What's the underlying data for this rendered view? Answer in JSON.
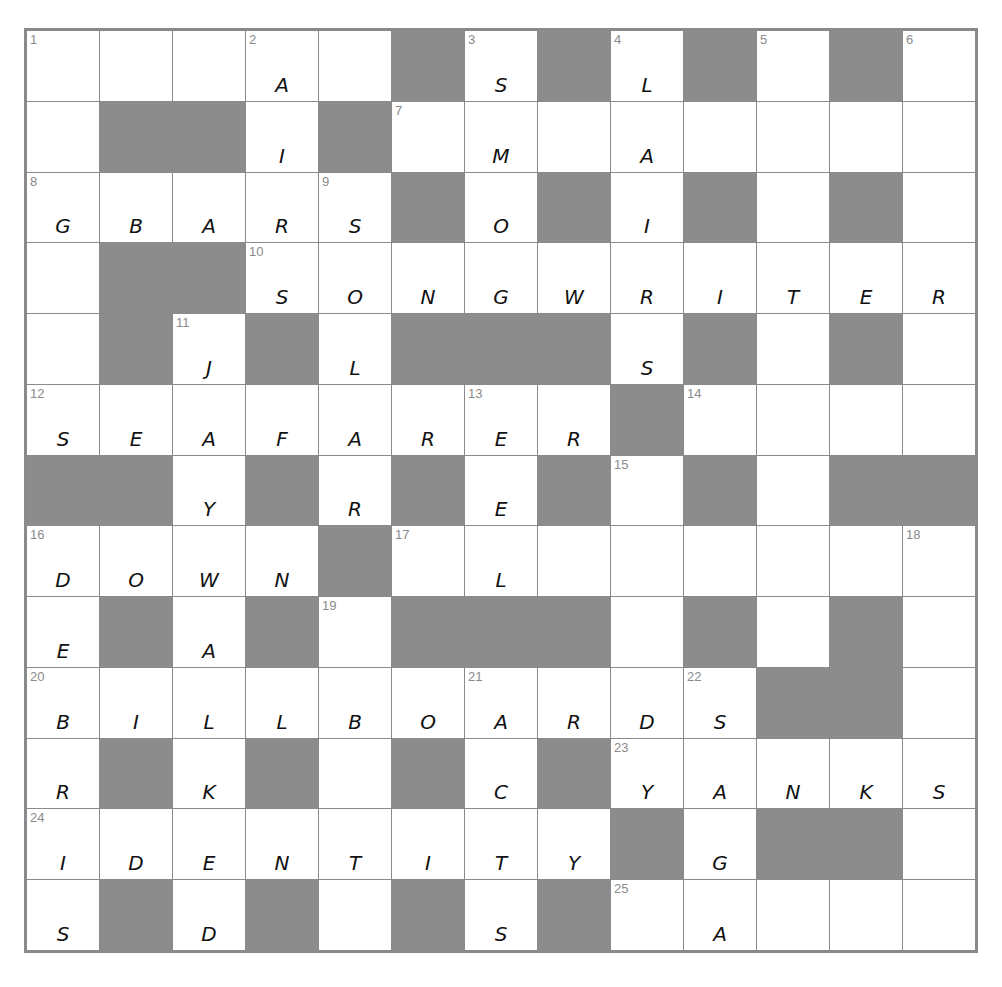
{
  "puzzle": {
    "size": 13,
    "colors": {
      "block": "#8c8c8c",
      "line": "#8a8a8a",
      "cell": "#ffffff",
      "ink": "#111111"
    },
    "rows": [
      [
        {
          "n": "1",
          "l": ""
        },
        {
          "n": "",
          "l": ""
        },
        {
          "n": "",
          "l": ""
        },
        {
          "n": "2",
          "l": "A"
        },
        {
          "n": "",
          "l": ""
        },
        {
          "b": 1
        },
        {
          "n": "3",
          "l": "S"
        },
        {
          "b": 1
        },
        {
          "n": "4",
          "l": "L"
        },
        {
          "b": 1
        },
        {
          "n": "5",
          "l": ""
        },
        {
          "b": 1
        },
        {
          "n": "6",
          "l": ""
        }
      ],
      [
        {
          "n": "",
          "l": ""
        },
        {
          "b": 1
        },
        {
          "b": 1
        },
        {
          "n": "",
          "l": "I"
        },
        {
          "b": 1
        },
        {
          "n": "7",
          "l": ""
        },
        {
          "n": "",
          "l": "M"
        },
        {
          "n": "",
          "l": ""
        },
        {
          "n": "",
          "l": "A"
        },
        {
          "n": "",
          "l": ""
        },
        {
          "n": "",
          "l": ""
        },
        {
          "n": "",
          "l": ""
        },
        {
          "n": "",
          "l": ""
        }
      ],
      [
        {
          "n": "8",
          "l": "G"
        },
        {
          "n": "",
          "l": "B"
        },
        {
          "n": "",
          "l": "A"
        },
        {
          "n": "",
          "l": "R"
        },
        {
          "n": "9",
          "l": "S"
        },
        {
          "b": 1
        },
        {
          "n": "",
          "l": "O"
        },
        {
          "b": 1
        },
        {
          "n": "",
          "l": "I"
        },
        {
          "b": 1
        },
        {
          "n": "",
          "l": ""
        },
        {
          "b": 1
        },
        {
          "n": "",
          "l": ""
        }
      ],
      [
        {
          "n": "",
          "l": ""
        },
        {
          "b": 1
        },
        {
          "b": 1
        },
        {
          "n": "10",
          "l": "S"
        },
        {
          "n": "",
          "l": "O"
        },
        {
          "n": "",
          "l": "N"
        },
        {
          "n": "",
          "l": "G"
        },
        {
          "n": "",
          "l": "W"
        },
        {
          "n": "",
          "l": "R"
        },
        {
          "n": "",
          "l": "I"
        },
        {
          "n": "",
          "l": "T"
        },
        {
          "n": "",
          "l": "E"
        },
        {
          "n": "",
          "l": "R"
        }
      ],
      [
        {
          "n": "",
          "l": ""
        },
        {
          "b": 1
        },
        {
          "n": "11",
          "l": "J"
        },
        {
          "b": 1
        },
        {
          "n": "",
          "l": "L"
        },
        {
          "b": 1
        },
        {
          "b": 1
        },
        {
          "b": 1
        },
        {
          "n": "",
          "l": "S"
        },
        {
          "b": 1
        },
        {
          "n": "",
          "l": ""
        },
        {
          "b": 1
        },
        {
          "n": "",
          "l": ""
        }
      ],
      [
        {
          "n": "12",
          "l": "S"
        },
        {
          "n": "",
          "l": "E"
        },
        {
          "n": "",
          "l": "A"
        },
        {
          "n": "",
          "l": "F"
        },
        {
          "n": "",
          "l": "A"
        },
        {
          "n": "",
          "l": "R"
        },
        {
          "n": "13",
          "l": "E"
        },
        {
          "n": "",
          "l": "R"
        },
        {
          "b": 1
        },
        {
          "n": "14",
          "l": ""
        },
        {
          "n": "",
          "l": ""
        },
        {
          "n": "",
          "l": ""
        },
        {
          "n": "",
          "l": ""
        }
      ],
      [
        {
          "b": 1
        },
        {
          "b": 1
        },
        {
          "n": "",
          "l": "Y"
        },
        {
          "b": 1
        },
        {
          "n": "",
          "l": "R"
        },
        {
          "b": 1
        },
        {
          "n": "",
          "l": "E"
        },
        {
          "b": 1
        },
        {
          "n": "15",
          "l": ""
        },
        {
          "b": 1
        },
        {
          "n": "",
          "l": ""
        },
        {
          "b": 1
        },
        {
          "b": 1
        }
      ],
      [
        {
          "n": "16",
          "l": "D"
        },
        {
          "n": "",
          "l": "O"
        },
        {
          "n": "",
          "l": "W"
        },
        {
          "n": "",
          "l": "N"
        },
        {
          "b": 1
        },
        {
          "n": "17",
          "l": ""
        },
        {
          "n": "",
          "l": "L"
        },
        {
          "n": "",
          "l": ""
        },
        {
          "n": "",
          "l": ""
        },
        {
          "n": "",
          "l": ""
        },
        {
          "n": "",
          "l": ""
        },
        {
          "n": "",
          "l": ""
        },
        {
          "n": "18",
          "l": ""
        }
      ],
      [
        {
          "n": "",
          "l": "E"
        },
        {
          "b": 1
        },
        {
          "n": "",
          "l": "A"
        },
        {
          "b": 1
        },
        {
          "n": "19",
          "l": ""
        },
        {
          "b": 1
        },
        {
          "b": 1
        },
        {
          "b": 1
        },
        {
          "n": "",
          "l": ""
        },
        {
          "b": 1
        },
        {
          "n": "",
          "l": ""
        },
        {
          "b": 1
        },
        {
          "n": "",
          "l": ""
        }
      ],
      [
        {
          "n": "20",
          "l": "B"
        },
        {
          "n": "",
          "l": "I"
        },
        {
          "n": "",
          "l": "L"
        },
        {
          "n": "",
          "l": "L"
        },
        {
          "n": "",
          "l": "B"
        },
        {
          "n": "",
          "l": "O"
        },
        {
          "n": "21",
          "l": "A"
        },
        {
          "n": "",
          "l": "R"
        },
        {
          "n": "",
          "l": "D"
        },
        {
          "n": "22",
          "l": "S"
        },
        {
          "b": 1
        },
        {
          "b": 1
        },
        {
          "n": "",
          "l": ""
        }
      ],
      [
        {
          "n": "",
          "l": "R"
        },
        {
          "b": 1
        },
        {
          "n": "",
          "l": "K"
        },
        {
          "b": 1
        },
        {
          "n": "",
          "l": ""
        },
        {
          "b": 1
        },
        {
          "n": "",
          "l": "C"
        },
        {
          "b": 1
        },
        {
          "n": "23",
          "l": "Y"
        },
        {
          "n": "",
          "l": "A"
        },
        {
          "n": "",
          "l": "N"
        },
        {
          "n": "",
          "l": "K"
        },
        {
          "n": "",
          "l": "S"
        }
      ],
      [
        {
          "n": "24",
          "l": "I"
        },
        {
          "n": "",
          "l": "D"
        },
        {
          "n": "",
          "l": "E"
        },
        {
          "n": "",
          "l": "N"
        },
        {
          "n": "",
          "l": "T"
        },
        {
          "n": "",
          "l": "I"
        },
        {
          "n": "",
          "l": "T"
        },
        {
          "n": "",
          "l": "Y"
        },
        {
          "b": 1
        },
        {
          "n": "",
          "l": "G"
        },
        {
          "b": 1
        },
        {
          "b": 1
        },
        {
          "n": "",
          "l": ""
        }
      ],
      [
        {
          "n": "",
          "l": "S"
        },
        {
          "b": 1
        },
        {
          "n": "",
          "l": "D"
        },
        {
          "b": 1
        },
        {
          "n": "",
          "l": ""
        },
        {
          "b": 1
        },
        {
          "n": "",
          "l": "S"
        },
        {
          "b": 1
        },
        {
          "n": "25",
          "l": ""
        },
        {
          "n": "",
          "l": "A"
        },
        {
          "n": "",
          "l": ""
        },
        {
          "n": "",
          "l": ""
        },
        {
          "n": "",
          "l": ""
        }
      ]
    ]
  }
}
